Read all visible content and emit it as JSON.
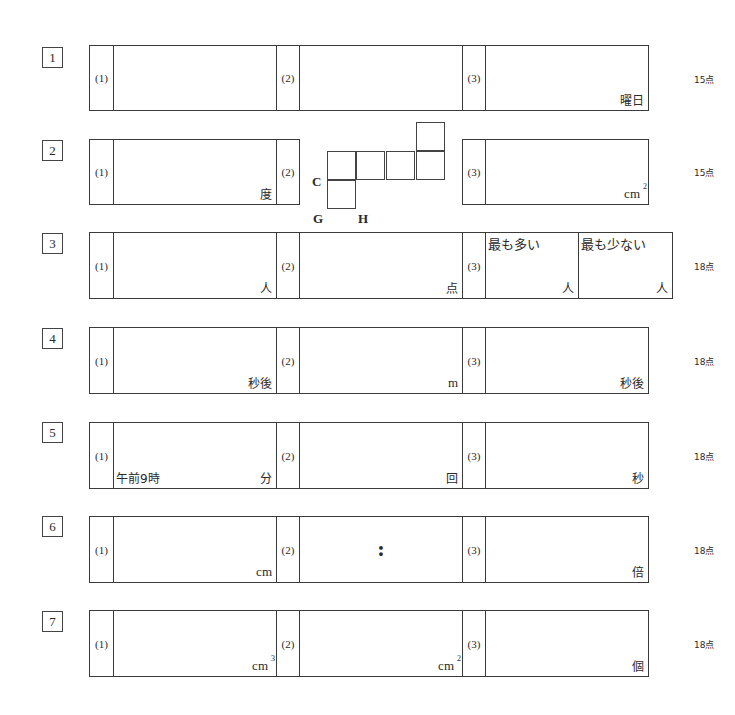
{
  "questions": [
    {
      "number": "1",
      "points": "15点",
      "parts": [
        {
          "label": "(1)",
          "unit": ""
        },
        {
          "label": "(2)",
          "unit": ""
        },
        {
          "label": "(3)",
          "unit": "曜日"
        }
      ]
    },
    {
      "number": "2",
      "points": "15点",
      "parts": [
        {
          "label": "(1)",
          "unit": "度"
        },
        {
          "label": "(2)",
          "unit": ""
        },
        {
          "label": "(3)",
          "unit": "cm",
          "sup": "2"
        }
      ],
      "figure": {
        "labels": {
          "c": "C",
          "g": "G",
          "h": "H"
        }
      }
    },
    {
      "number": "3",
      "points": "18点",
      "parts": [
        {
          "label": "(1)",
          "unit": "人"
        },
        {
          "label": "(2)",
          "unit": "点"
        },
        {
          "label": "(3)",
          "sub": [
            {
              "caption": "最も多い",
              "unit": "人"
            },
            {
              "caption": "最も少ない",
              "unit": "人"
            }
          ]
        }
      ]
    },
    {
      "number": "4",
      "points": "18点",
      "parts": [
        {
          "label": "(1)",
          "unit": "秒後"
        },
        {
          "label": "(2)",
          "unit": "m"
        },
        {
          "label": "(3)",
          "unit": "秒後"
        }
      ]
    },
    {
      "number": "5",
      "points": "18点",
      "parts": [
        {
          "label": "(1)",
          "prefix": "午前9時",
          "unit": "分"
        },
        {
          "label": "(2)",
          "unit": "回"
        },
        {
          "label": "(3)",
          "unit": "秒"
        }
      ]
    },
    {
      "number": "6",
      "points": "18点",
      "parts": [
        {
          "label": "(1)",
          "unit": "cm"
        },
        {
          "label": "(2)",
          "unit": "",
          "middle": ":"
        },
        {
          "label": "(3)",
          "unit": "倍"
        }
      ]
    },
    {
      "number": "7",
      "points": "18点",
      "parts": [
        {
          "label": "(1)",
          "unit": "cm",
          "sup": "3"
        },
        {
          "label": "(2)",
          "unit": "cm",
          "sup": "2"
        },
        {
          "label": "(3)",
          "unit": "個"
        }
      ]
    }
  ]
}
